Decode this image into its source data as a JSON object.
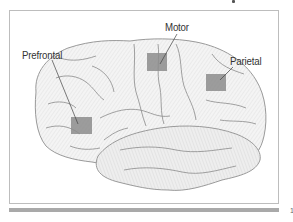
{
  "figure": {
    "type": "lateral brain illustration",
    "labels": [
      {
        "id": "prefrontal",
        "text": "Prefrontal"
      },
      {
        "id": "motor",
        "text": "Motor"
      },
      {
        "id": "parietal",
        "text": "Parietal"
      }
    ],
    "marker_color": "#8c8c8c",
    "outline_color": "#9a9a9a",
    "fill_color": "#f2f2f2",
    "frame_color": "#bdbdbd",
    "bar_color": "#a9a9a9"
  },
  "page_mark": "1"
}
